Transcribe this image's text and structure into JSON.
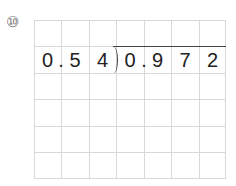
{
  "problem_number": "⑩",
  "divisor": [
    "0",
    ".",
    "5",
    "4"
  ],
  "dividend": [
    "0",
    ".",
    "9",
    "7",
    "2"
  ],
  "grid": {
    "columns": 7,
    "rows": 6
  }
}
